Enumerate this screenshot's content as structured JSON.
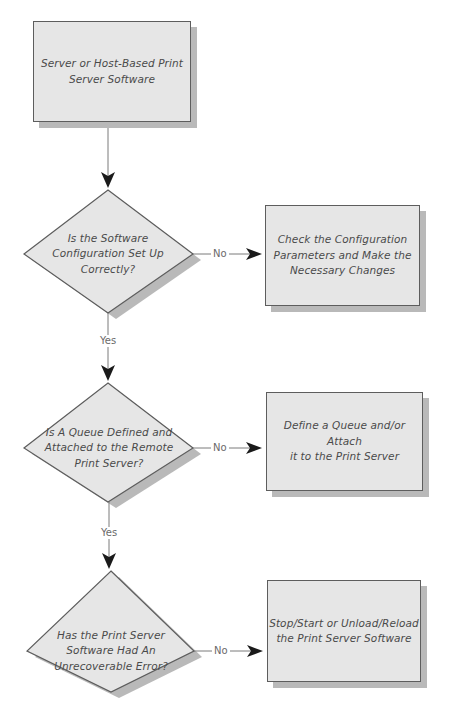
{
  "diagram": {
    "type": "flowchart",
    "start": {
      "id": "start",
      "label": "Server or Host-Based Print Server Software",
      "lines": [
        "Server or Host-Based Print",
        "Server Software"
      ]
    },
    "decisions": [
      {
        "id": "d1",
        "lines": [
          "Is the Software",
          "Configuration Set Up",
          "Correctly?"
        ],
        "no_label": "No",
        "yes_label": "Yes",
        "no_action": {
          "id": "a1",
          "lines": [
            "Check the Configuration",
            "Parameters and Make the",
            "Necessary Changes"
          ]
        }
      },
      {
        "id": "d2",
        "lines": [
          "Is A Queue Defined and",
          "Attached to the Remote",
          "Print Server?"
        ],
        "no_label": "No",
        "yes_label": "Yes",
        "no_action": {
          "id": "a2",
          "lines": [
            "Define a Queue and/or Attach",
            "it to the Print Server"
          ]
        }
      },
      {
        "id": "d3",
        "lines": [
          "Has the Print Server",
          "Software Had An",
          "Unrecoverable Error?"
        ],
        "no_label": "No",
        "no_action": {
          "id": "a3",
          "lines": [
            "Stop/Start or Unload/Reload",
            "the Print Server Software"
          ]
        }
      }
    ],
    "colors": {
      "shape_fill": "#e6e6e6",
      "shape_border": "#5d5d5d",
      "shadow": "#b9b9b9",
      "connector": "#7a7a7a",
      "arrowhead": "#1a1a1a",
      "text": "#4a4a4a"
    }
  }
}
